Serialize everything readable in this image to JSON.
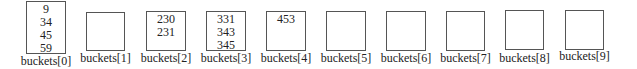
{
  "diagram": {
    "title": "",
    "buckets": [
      {
        "label": "buckets[0]",
        "values": [
          "9",
          "34",
          "45",
          "59"
        ]
      },
      {
        "label": "buckets[1]",
        "values": []
      },
      {
        "label": "buckets[2]",
        "values": [
          "230",
          "231"
        ]
      },
      {
        "label": "buckets[3]",
        "values": [
          "331",
          "343",
          "345"
        ]
      },
      {
        "label": "buckets[4]",
        "values": [
          "453"
        ]
      },
      {
        "label": "buckets[5]",
        "values": []
      },
      {
        "label": "buckets[6]",
        "values": []
      },
      {
        "label": "buckets[7]",
        "values": []
      },
      {
        "label": "buckets[8]",
        "values": []
      },
      {
        "label": "buckets[9]",
        "values": []
      }
    ],
    "colors": {
      "border": "#555555",
      "text": "#222222",
      "background": "#ffffff"
    }
  }
}
